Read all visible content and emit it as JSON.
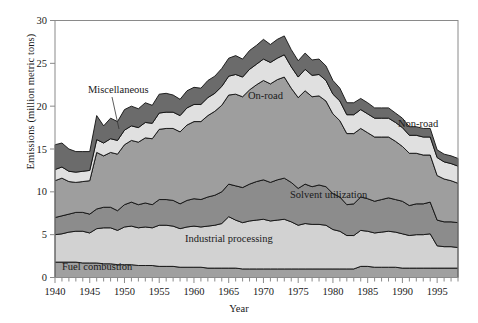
{
  "chart_data": {
    "type": "area",
    "stacked": true,
    "title": "",
    "xlabel": "Year",
    "ylabel": "Emissions (million metric tons)",
    "xlim": [
      1940,
      1998
    ],
    "ylim": [
      0,
      30
    ],
    "yticks": [
      0,
      5,
      10,
      15,
      20,
      25,
      30
    ],
    "xticks_labeled": [
      1940,
      1945,
      1950,
      1955,
      1960,
      1965,
      1970,
      1975,
      1980,
      1985,
      1990,
      1995
    ],
    "xtick_interval": 1,
    "grid": false,
    "legend": "inline-area-labels",
    "x": [
      1940,
      1941,
      1942,
      1943,
      1944,
      1945,
      1946,
      1947,
      1948,
      1949,
      1950,
      1951,
      1952,
      1953,
      1954,
      1955,
      1956,
      1957,
      1958,
      1959,
      1960,
      1961,
      1962,
      1963,
      1964,
      1965,
      1966,
      1967,
      1968,
      1969,
      1970,
      1971,
      1972,
      1973,
      1974,
      1975,
      1976,
      1977,
      1978,
      1979,
      1980,
      1981,
      1982,
      1983,
      1984,
      1985,
      1986,
      1987,
      1988,
      1989,
      1990,
      1991,
      1992,
      1993,
      1994,
      1995,
      1996,
      1997,
      1998
    ],
    "series": [
      {
        "name": "Fuel combustion",
        "color": "#a0a0a0",
        "values": [
          1.8,
          1.8,
          1.8,
          1.8,
          1.7,
          1.7,
          1.7,
          1.6,
          1.6,
          1.5,
          1.5,
          1.5,
          1.4,
          1.4,
          1.4,
          1.3,
          1.3,
          1.3,
          1.2,
          1.2,
          1.2,
          1.2,
          1.1,
          1.1,
          1.1,
          1.1,
          1.1,
          1.0,
          1.0,
          1.0,
          1.0,
          1.0,
          1.0,
          1.0,
          1.0,
          1.0,
          1.0,
          1.0,
          1.0,
          1.0,
          1.0,
          1.0,
          1.0,
          1.0,
          1.3,
          1.3,
          1.2,
          1.2,
          1.2,
          1.2,
          1.1,
          1.1,
          1.1,
          1.1,
          1.1,
          1.1,
          1.1,
          1.1,
          1.1
        ]
      },
      {
        "name": "Industrial processing",
        "color": "#d2d2d2",
        "values": [
          3.2,
          3.3,
          3.5,
          3.6,
          3.7,
          3.5,
          4.0,
          4.2,
          4.2,
          4.0,
          4.4,
          4.5,
          4.4,
          4.5,
          4.4,
          4.8,
          4.8,
          4.7,
          4.5,
          4.7,
          4.8,
          4.7,
          4.9,
          5.0,
          5.2,
          6.0,
          5.6,
          5.4,
          5.6,
          5.7,
          5.8,
          5.6,
          5.7,
          5.8,
          5.5,
          5.1,
          5.3,
          5.2,
          5.2,
          5.1,
          4.6,
          4.4,
          3.9,
          3.9,
          4.2,
          4.1,
          4.0,
          4.1,
          4.2,
          4.1,
          4.0,
          3.8,
          3.9,
          3.9,
          4.0,
          2.6,
          2.5,
          2.5,
          2.4
        ]
      },
      {
        "name": "Solvent utilization",
        "color": "#8c8c8c",
        "values": [
          2.0,
          2.1,
          2.1,
          2.2,
          2.2,
          2.2,
          2.3,
          2.4,
          2.4,
          2.3,
          2.6,
          2.8,
          2.7,
          2.8,
          2.7,
          3.0,
          3.0,
          3.0,
          2.9,
          3.1,
          3.2,
          3.2,
          3.4,
          3.5,
          3.7,
          3.8,
          4.0,
          4.1,
          4.3,
          4.5,
          4.6,
          4.5,
          4.7,
          4.8,
          4.6,
          4.3,
          4.6,
          4.4,
          4.6,
          4.5,
          4.2,
          4.0,
          3.6,
          3.7,
          3.9,
          3.8,
          3.7,
          3.8,
          3.9,
          3.8,
          3.8,
          3.5,
          3.6,
          3.6,
          3.7,
          3.0,
          2.9,
          2.9,
          2.9
        ]
      },
      {
        "name": "On-road",
        "color": "#9e9e9e",
        "values": [
          4.3,
          4.4,
          3.8,
          3.5,
          3.6,
          3.9,
          6.6,
          6.0,
          6.4,
          6.6,
          7.0,
          7.2,
          7.3,
          7.6,
          7.7,
          8.2,
          8.3,
          8.4,
          8.4,
          8.8,
          9.0,
          9.1,
          9.5,
          9.8,
          10.1,
          10.4,
          10.7,
          10.6,
          11.0,
          11.3,
          11.6,
          11.5,
          11.7,
          11.8,
          11.0,
          10.6,
          10.9,
          10.5,
          10.4,
          10.0,
          9.3,
          8.9,
          8.3,
          8.2,
          8.0,
          7.7,
          7.5,
          7.3,
          7.1,
          6.8,
          6.4,
          6.1,
          5.9,
          5.7,
          5.5,
          5.2,
          5.0,
          4.8,
          4.6
        ]
      },
      {
        "name": "Non-road",
        "color": "#e0e0e0",
        "values": [
          1.3,
          1.3,
          1.2,
          1.2,
          1.2,
          1.2,
          1.5,
          1.5,
          1.6,
          1.6,
          1.7,
          1.7,
          1.7,
          1.8,
          1.8,
          1.9,
          1.9,
          1.9,
          1.9,
          2.0,
          2.0,
          2.0,
          2.1,
          2.1,
          2.2,
          2.2,
          2.3,
          2.3,
          2.4,
          2.4,
          2.5,
          2.5,
          2.5,
          2.6,
          2.5,
          2.4,
          2.5,
          2.5,
          2.5,
          2.4,
          2.3,
          2.3,
          2.2,
          2.2,
          2.2,
          2.2,
          2.2,
          2.2,
          2.2,
          2.2,
          2.2,
          2.1,
          2.1,
          2.1,
          2.1,
          2.1,
          2.0,
          2.0,
          2.0
        ]
      },
      {
        "name": "Miscellaneous",
        "color": "#6b6b6b",
        "values": [
          2.9,
          2.8,
          2.6,
          2.4,
          2.3,
          2.2,
          2.8,
          2.0,
          2.4,
          2.2,
          2.4,
          2.3,
          2.2,
          2.3,
          2.1,
          2.2,
          2.2,
          2.0,
          1.9,
          2.0,
          2.0,
          1.9,
          2.0,
          2.0,
          2.1,
          2.1,
          2.2,
          2.1,
          2.2,
          2.2,
          2.3,
          2.1,
          2.2,
          2.2,
          2.0,
          1.9,
          1.9,
          1.8,
          1.8,
          1.7,
          1.6,
          1.5,
          1.4,
          1.4,
          1.3,
          1.3,
          1.2,
          1.2,
          1.2,
          1.1,
          1.1,
          1.0,
          1.0,
          1.0,
          1.0,
          0.9,
          0.9,
          0.9,
          0.9
        ]
      }
    ],
    "annotations": [
      {
        "name": "Miscellaneous",
        "text": "Miscellaneous",
        "x": 88,
        "y": 93,
        "leader": true
      },
      {
        "name": "On-road",
        "text": "On-road",
        "x": 248,
        "y": 99,
        "leader": false
      },
      {
        "name": "Non-road",
        "text": "Non-road",
        "x": 398,
        "y": 127,
        "leader": false
      },
      {
        "name": "Solvent utilization",
        "text": "Solvent utilization",
        "x": 290,
        "y": 198,
        "leader": false
      },
      {
        "name": "Industrial processing",
        "text": "Industrial processing",
        "x": 185,
        "y": 242,
        "leader": false
      },
      {
        "name": "Fuel combustion",
        "text": "Fuel combustion",
        "x": 62,
        "y": 270,
        "leader": false
      }
    ]
  },
  "axes": {
    "ylabel": "Emissions (million metric tons)",
    "xlabel": "Year"
  }
}
